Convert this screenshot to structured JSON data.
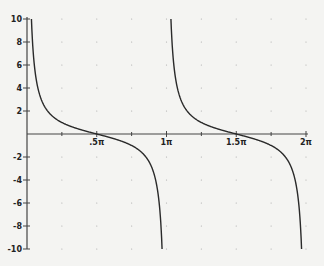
{
  "chart_data": {
    "type": "line",
    "title": "",
    "function": "cot(x)",
    "xlabel": "",
    "ylabel": "",
    "xlim": [
      0,
      6.2832
    ],
    "ylim": [
      -10,
      10
    ],
    "x_ticks": [
      {
        "value": 1.5708,
        "label": ".5π"
      },
      {
        "value": 3.1416,
        "label": "1π"
      },
      {
        "value": 4.7124,
        "label": "1.5π"
      },
      {
        "value": 6.2832,
        "label": "2π"
      }
    ],
    "y_ticks": [
      {
        "value": 10,
        "label": "10"
      },
      {
        "value": 8,
        "label": "8"
      },
      {
        "value": 6,
        "label": "6"
      },
      {
        "value": 4,
        "label": "4"
      },
      {
        "value": 2,
        "label": "2"
      },
      {
        "value": -2,
        "label": "-2"
      },
      {
        "value": -4,
        "label": "-4"
      },
      {
        "value": -6,
        "label": "-6"
      },
      {
        "value": -8,
        "label": "-8"
      },
      {
        "value": -10,
        "label": "-10"
      }
    ],
    "grid": "dotted",
    "legend": "none",
    "series": [
      {
        "name": "cot(x) branch 1",
        "domain": [
          0.0997,
          3.0419
        ]
      },
      {
        "name": "cot(x) branch 2",
        "domain": [
          3.2413,
          6.1835
        ]
      }
    ],
    "sample_points": [
      {
        "x": 0.1,
        "y": 9.97
      },
      {
        "x": 0.25,
        "y": 3.92
      },
      {
        "x": 0.5,
        "y": 1.83
      },
      {
        "x": 0.7854,
        "y": 1.0
      },
      {
        "x": 1.5708,
        "y": 0.0
      },
      {
        "x": 2.3562,
        "y": -1.0
      },
      {
        "x": 2.8,
        "y": -2.82
      },
      {
        "x": 3.04,
        "y": -9.87
      },
      {
        "x": 3.24,
        "y": 9.97
      },
      {
        "x": 3.927,
        "y": 1.0
      },
      {
        "x": 4.7124,
        "y": 0.0
      },
      {
        "x": 5.4978,
        "y": -1.0
      },
      {
        "x": 6.18,
        "y": -9.7
      }
    ],
    "colors": {
      "curve": "#2a2a2a",
      "axis": "#444444",
      "grid_dot": "#aaaaaa",
      "background": "#f4f4f2"
    }
  }
}
